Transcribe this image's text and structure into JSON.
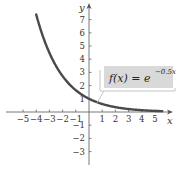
{
  "chart_data": {
    "type": "line",
    "title": "",
    "xlabel": "x",
    "ylabel": "y",
    "xlim": [
      -5.5,
      6
    ],
    "ylim": [
      -4,
      8
    ],
    "grid": false,
    "x_ticks": [
      -5,
      -4,
      -3,
      -2,
      -1,
      1,
      2,
      3,
      4,
      5
    ],
    "y_ticks": [
      -3,
      -2,
      -1,
      1,
      2,
      3,
      4,
      5,
      6,
      7
    ],
    "x_tick_labels": [
      "−5",
      "−4",
      "−3",
      "−2",
      "−1",
      "1",
      "2",
      "3",
      "4",
      "5"
    ],
    "y_tick_labels": [
      "−3",
      "−2",
      "−1",
      "1",
      "2",
      "3",
      "4",
      "5",
      "6",
      "7"
    ],
    "series": [
      {
        "name": "f(x) = e^(−0.5x)",
        "function": "e^(-0.5x)",
        "color": "#4a4a4a",
        "x": [
          -4,
          -3,
          -2,
          -1,
          0,
          1,
          2,
          3,
          4,
          5,
          5.5
        ],
        "y": [
          7.39,
          4.48,
          2.72,
          1.65,
          1.0,
          0.61,
          0.37,
          0.22,
          0.14,
          0.08,
          0.06
        ]
      }
    ],
    "annotations": [
      {
        "text_main": "f(x) = e",
        "text_sup": "−0.5x",
        "points_to_x": 0.6,
        "box_fill": "#d9d9d9"
      }
    ]
  },
  "labels": {
    "x_axis": "x",
    "y_axis": "y",
    "fn_main": "f(x) = e",
    "fn_sup": "−0.5x"
  }
}
